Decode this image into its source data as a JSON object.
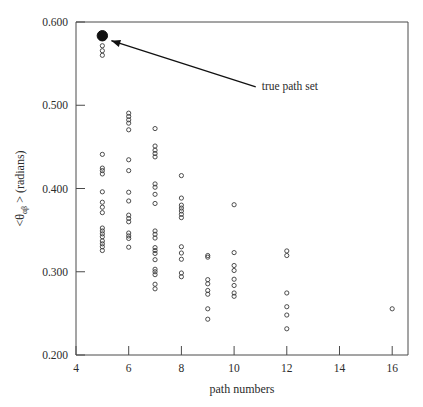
{
  "chart_data": {
    "type": "scatter",
    "title": "",
    "xlabel": "path numbers",
    "ylabel": "<θαβ > (radians)",
    "ylabel_parts": {
      "prefix": "<θ",
      "subscript": "αβ",
      "suffix": " > (radians)"
    },
    "xlim": [
      4,
      16.6
    ],
    "ylim": [
      0.2,
      0.6
    ],
    "xticks": [
      4,
      6,
      8,
      10,
      12,
      14,
      16
    ],
    "xtick_labels": [
      "4",
      "6",
      "8",
      "10",
      "12",
      "14",
      "16"
    ],
    "yticks": [
      0.2,
      0.3,
      0.4,
      0.5,
      0.6
    ],
    "ytick_labels": [
      "0.200",
      "0.300",
      "0.400",
      "0.500",
      "0.600"
    ],
    "grid": false,
    "legend": "none",
    "marker_open": "open-circle",
    "marker_highlight": "filled-circle",
    "annotations": [
      {
        "text": "true path set",
        "target_x": 5.0,
        "target_y": 0.5835,
        "label_x": 11.05,
        "label_y": 0.5185,
        "arrow": "line-with-arrowhead"
      }
    ],
    "series": [
      {
        "name": "true path set",
        "style": "filled",
        "points": [
          [
            5.0,
            0.5835
          ]
        ]
      },
      {
        "name": "candidate path sets",
        "style": "open",
        "points": [
          [
            5.0,
            0.5715
          ],
          [
            5.0,
            0.5655
          ],
          [
            5.0,
            0.56
          ],
          [
            5.0,
            0.441
          ],
          [
            5.0,
            0.4245
          ],
          [
            5.0,
            0.4215
          ],
          [
            5.0,
            0.4175
          ],
          [
            5.0,
            0.396
          ],
          [
            5.0,
            0.3835
          ],
          [
            5.0,
            0.3775
          ],
          [
            5.0,
            0.371
          ],
          [
            5.0,
            0.3525
          ],
          [
            5.0,
            0.349
          ],
          [
            5.0,
            0.3455
          ],
          [
            5.0,
            0.342
          ],
          [
            5.0,
            0.337
          ],
          [
            5.0,
            0.3335
          ],
          [
            5.0,
            0.33
          ],
          [
            5.0,
            0.3255
          ],
          [
            6.0,
            0.4905
          ],
          [
            6.0,
            0.4865
          ],
          [
            6.0,
            0.4825
          ],
          [
            6.0,
            0.4785
          ],
          [
            6.0,
            0.4705
          ],
          [
            6.0,
            0.4345
          ],
          [
            6.0,
            0.4215
          ],
          [
            6.0,
            0.3955
          ],
          [
            6.0,
            0.385
          ],
          [
            6.0,
            0.368
          ],
          [
            6.0,
            0.364
          ],
          [
            6.0,
            0.36
          ],
          [
            6.0,
            0.3465
          ],
          [
            6.0,
            0.343
          ],
          [
            6.0,
            0.34
          ],
          [
            6.0,
            0.3295
          ],
          [
            7.0,
            0.472
          ],
          [
            7.0,
            0.451
          ],
          [
            7.0,
            0.446
          ],
          [
            7.0,
            0.442
          ],
          [
            7.0,
            0.438
          ],
          [
            7.0,
            0.4055
          ],
          [
            7.0,
            0.4015
          ],
          [
            7.0,
            0.393
          ],
          [
            7.0,
            0.382
          ],
          [
            7.0,
            0.349
          ],
          [
            7.0,
            0.345
          ],
          [
            7.0,
            0.3405
          ],
          [
            7.0,
            0.329
          ],
          [
            7.0,
            0.3255
          ],
          [
            7.0,
            0.322
          ],
          [
            7.0,
            0.3145
          ],
          [
            7.0,
            0.303
          ],
          [
            7.0,
            0.3
          ],
          [
            7.0,
            0.2965
          ],
          [
            7.0,
            0.285
          ],
          [
            7.0,
            0.2795
          ],
          [
            8.0,
            0.4155
          ],
          [
            8.0,
            0.3885
          ],
          [
            8.0,
            0.38
          ],
          [
            8.0,
            0.3765
          ],
          [
            8.0,
            0.373
          ],
          [
            8.0,
            0.369
          ],
          [
            8.0,
            0.365
          ],
          [
            8.0,
            0.33
          ],
          [
            8.0,
            0.3225
          ],
          [
            8.0,
            0.315
          ],
          [
            8.0,
            0.2985
          ],
          [
            8.0,
            0.294
          ],
          [
            9.0,
            0.3195
          ],
          [
            9.0,
            0.3175
          ],
          [
            9.0,
            0.2905
          ],
          [
            9.0,
            0.2855
          ],
          [
            9.0,
            0.2775
          ],
          [
            9.0,
            0.273
          ],
          [
            9.0,
            0.2555
          ],
          [
            9.0,
            0.243
          ],
          [
            10.0,
            0.3805
          ],
          [
            10.0,
            0.323
          ],
          [
            10.0,
            0.3075
          ],
          [
            10.0,
            0.3015
          ],
          [
            10.0,
            0.291
          ],
          [
            10.0,
            0.2835
          ],
          [
            10.0,
            0.2745
          ],
          [
            10.0,
            0.2705
          ],
          [
            12.0,
            0.325
          ],
          [
            12.0,
            0.3195
          ],
          [
            12.0,
            0.2745
          ],
          [
            12.0,
            0.258
          ],
          [
            12.0,
            0.248
          ],
          [
            12.0,
            0.2315
          ],
          [
            16.0,
            0.2555
          ]
        ]
      }
    ]
  }
}
